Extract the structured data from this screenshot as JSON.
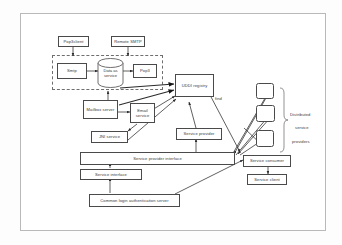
{
  "diagram": {
    "frame": {
      "stroke": "#b9b9b9"
    },
    "colors": {
      "node_stroke": "#4a4a4a",
      "node_fill": "#ffffff",
      "text": "#3a3a3a",
      "edge": "#2b2b2b",
      "dashed_group": "#6e6e6e",
      "background": "#fdfdfd"
    },
    "nodes": [
      {
        "id": "pop3client",
        "label": "Pop3client",
        "shape": "rect"
      },
      {
        "id": "remote_smtp",
        "label": "Remote SMTP",
        "shape": "rect"
      },
      {
        "id": "smtp",
        "label": "Smtp",
        "shape": "rect"
      },
      {
        "id": "data_as_service",
        "label": "Data as service",
        "shape": "cylinder"
      },
      {
        "id": "pop3",
        "label": "Pop3",
        "shape": "rect"
      },
      {
        "id": "mailbox_server",
        "label": "Mailbox server",
        "shape": "rect"
      },
      {
        "id": "email_service",
        "label": "Email service",
        "shape": "rect"
      },
      {
        "id": "jni_service",
        "label": "JNI service",
        "shape": "rect"
      },
      {
        "id": "uddi_registry",
        "label": "UDDI registry",
        "shape": "rect"
      },
      {
        "id": "service_provider",
        "label": "Service provider",
        "shape": "rect"
      },
      {
        "id": "service_provider_interface",
        "label": "Service provider interface",
        "shape": "rect"
      },
      {
        "id": "service_interface",
        "label": "Service interface",
        "shape": "rect"
      },
      {
        "id": "service_consumer",
        "label": "Service consumer",
        "shape": "rect"
      },
      {
        "id": "service_client",
        "label": "Service client",
        "shape": "rect"
      },
      {
        "id": "common_login",
        "label": "Common login authentication server",
        "shape": "rect"
      },
      {
        "id": "dsp1",
        "label": "",
        "shape": "rounded-rect"
      },
      {
        "id": "dsp2",
        "label": "",
        "shape": "rounded-rect"
      },
      {
        "id": "dsp3",
        "label": "",
        "shape": "rounded-rect"
      }
    ],
    "free_labels": {
      "find": "find",
      "distributed": "Distributed",
      "service": "service",
      "providers": "providers"
    }
  }
}
